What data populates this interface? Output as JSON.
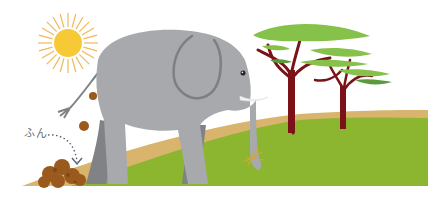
{
  "illustration": {
    "subject": "elephant walking on savanna leaving dung",
    "label_text": "ふん",
    "label_meaning": "dung"
  },
  "elements": {
    "sun": {
      "icon": "sun-icon"
    },
    "elephant": {
      "icon": "elephant-icon"
    },
    "trees": {
      "icon": "acacia-tree-icon",
      "count": 2
    },
    "dung_pile": {
      "icon": "dung-pile-icon"
    },
    "falling_dung": {
      "icon": "dung-ball-icon",
      "count": 2
    },
    "grass_tuft": {
      "icon": "grass-tuft-icon"
    },
    "pointer": {
      "icon": "dotted-arrow-icon"
    }
  },
  "colors": {
    "sun_core": "#f7c936",
    "sun_rays": "#f0b85a",
    "elephant_body": "#a7a9ac",
    "elephant_far_leg": "#808285",
    "elephant_ear_line": "#7d7f82",
    "tusk": "#f2f2f2",
    "ground_green": "#8cb630",
    "ground_sand": "#d8b46c",
    "tree_trunk": "#7a1218",
    "tree_canopy_light": "#86c14a",
    "tree_canopy_dark": "#5a9a3c",
    "dung": "#9a5a1e",
    "arrow": "#5a6270"
  }
}
